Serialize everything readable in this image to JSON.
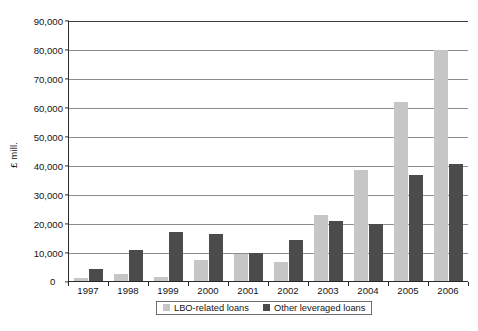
{
  "chart_data": {
    "type": "bar",
    "title": "",
    "subtitle": "",
    "xlabel": "",
    "ylabel": "£ mill.",
    "ylim": [
      0,
      90000
    ],
    "ytick_labels": [
      "90,000",
      "80,000",
      "70,000",
      "60,000",
      "50,000",
      "40,000",
      "30,000",
      "20,000",
      "10,000",
      "0"
    ],
    "ytick_values": [
      90000,
      80000,
      70000,
      60000,
      50000,
      40000,
      30000,
      20000,
      10000,
      0
    ],
    "grid": true,
    "legend_position": "bottom",
    "categories": [
      "1997",
      "1998",
      "1999",
      "2000",
      "2001",
      "2002",
      "2003",
      "2004",
      "2005",
      "2006"
    ],
    "series": [
      {
        "name": "LBO-related loans",
        "color": "#c6c6c6",
        "values": [
          1200,
          2400,
          1300,
          7200,
          9200,
          6500,
          22700,
          38300,
          61800,
          79500
        ]
      },
      {
        "name": "Other leveraged loans",
        "color": "#4b4b4b",
        "values": [
          4000,
          10600,
          17000,
          16200,
          9800,
          14000,
          20700,
          19600,
          36700,
          40400
        ]
      }
    ]
  },
  "legend": {
    "entries": [
      {
        "label": "LBO-related loans"
      },
      {
        "label": "Other leveraged loans"
      }
    ]
  },
  "axes": {
    "y_title": "£ mill.",
    "zero_label": "0"
  },
  "caption": {
    "text": ""
  },
  "colors": {
    "series1": "#c6c6c6",
    "series2": "#4b4b4b",
    "gridline": "#8d8d8d",
    "axis": "#2a2a2a",
    "background": "#ffffff"
  }
}
